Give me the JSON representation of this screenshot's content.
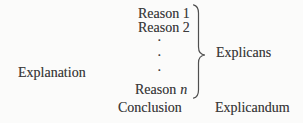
{
  "diagram": {
    "left_label": "Explanation",
    "premises": [
      "Reason 1",
      "Reason 2"
    ],
    "ellipsis_dot": "·",
    "last_premise_prefix": "Reason",
    "last_premise_variable": "n",
    "conclusion": "Conclusion",
    "brace_group_label": "Explicans",
    "conclusion_label": "Explicandum"
  },
  "colors": {
    "text": "#3c3c3c",
    "background": "#fbfbfa",
    "brace": "#4f4f4f"
  }
}
